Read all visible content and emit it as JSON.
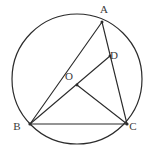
{
  "figure": {
    "kind": "circle-geometry-diagram",
    "background_color": "#ffffff",
    "stroke_color": "#2b2b2b",
    "label_color": "#3a3a3a",
    "width": 155,
    "height": 154
  },
  "circle": {
    "name": "circumscribed-circle",
    "center_x": 77,
    "center_y": 79,
    "radius": 65
  },
  "points": [
    {
      "id": "A",
      "label": "A",
      "x": 102,
      "y": 22,
      "label_x": 104,
      "label_y": 13,
      "on_circle": true
    },
    {
      "id": "B",
      "label": "B",
      "x": 30,
      "y": 124,
      "label_x": 17,
      "label_y": 130,
      "on_circle": true
    },
    {
      "id": "C",
      "label": "C",
      "x": 127,
      "y": 124,
      "label_x": 133,
      "label_y": 130,
      "on_circle": true
    },
    {
      "id": "D",
      "label": "D",
      "x": 110,
      "y": 56,
      "label_x": 114,
      "label_y": 59,
      "on_circle": false
    },
    {
      "id": "O",
      "label": "O",
      "x": 77,
      "y": 85,
      "label_x": 69,
      "label_y": 80,
      "on_circle": false
    }
  ],
  "segments": [
    {
      "id": "AB",
      "name": "segment-a-b",
      "from": "A",
      "to": "B"
    },
    {
      "id": "AC",
      "name": "segment-a-c",
      "from": "A",
      "to": "C"
    },
    {
      "id": "BC",
      "name": "segment-b-c",
      "from": "B",
      "to": "C"
    },
    {
      "id": "BD",
      "name": "segment-b-d-through-o",
      "from": "B",
      "to": "D"
    },
    {
      "id": "OC",
      "name": "segment-o-c",
      "from": "O",
      "to": "C"
    }
  ]
}
